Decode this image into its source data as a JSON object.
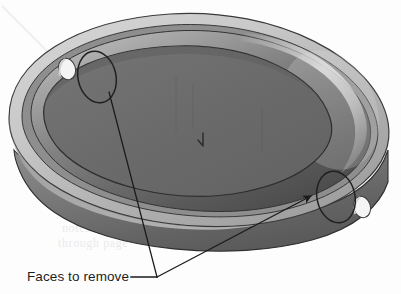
{
  "figure": {
    "kind": "cad-3d-shaded-view",
    "background_color": "#fdfdfd",
    "annotation": {
      "caption": "Faces to remove",
      "caption_color": "#1d1d1d",
      "caption_position": {
        "x": 27,
        "y": 281
      },
      "leader_color": "#1a1a1a",
      "leader_junction": {
        "x": 157,
        "y": 277
      },
      "leader_dash": {
        "x1": 131,
        "y1": 277,
        "x2": 157,
        "y2": 277
      },
      "leaders": [
        {
          "label": "leader-to-upper-left-face",
          "from": {
            "x": 157,
            "y": 277
          },
          "to": {
            "x": 109,
            "y": 92
          },
          "arrowhead": "none"
        },
        {
          "label": "leader-to-lower-right-face",
          "from": {
            "x": 157,
            "y": 277
          },
          "to": {
            "x": 311,
            "y": 196
          },
          "arrowhead": "filled-triangle"
        }
      ]
    },
    "part": {
      "body_outline_color": "#3a3a3a",
      "top_face_color": "#6a6a6a",
      "dome_light": "#9c9c9c",
      "dome_dark": "#4e4e4e",
      "dome_highlight": "#d8d8d8",
      "rim_band_color": "#c4c4c4",
      "rim_shadow_color": "#8e8e8e",
      "side_wall_color": "#707070",
      "hole_fill": "#f2f2f2",
      "holes": [
        {
          "label": "through-hole-upper-left",
          "cx": 67,
          "cy": 69,
          "rx": 8.5,
          "ry": 11
        },
        {
          "label": "through-hole-lower-right",
          "cx": 362,
          "cy": 207,
          "rx": 8.5,
          "ry": 11
        }
      ],
      "selected_faces": [
        {
          "label": "face-upper-left",
          "cx": 97,
          "cy": 77,
          "rx": 19,
          "ry": 26,
          "rotation": -12
        },
        {
          "label": "face-lower-right",
          "cx": 336,
          "cy": 197,
          "rx": 19,
          "ry": 26,
          "rotation": -12
        }
      ],
      "origin_marker": {
        "x": 203,
        "y": 141,
        "color": "#3c3c3c"
      }
    },
    "ghost_bleed_text": [
      {
        "text": "notes bleed",
        "x": 62,
        "y": 232
      },
      {
        "text": "through page",
        "x": 58,
        "y": 247
      }
    ]
  }
}
